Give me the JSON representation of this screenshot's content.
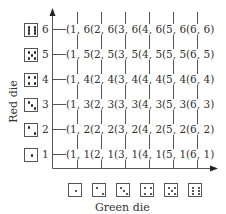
{
  "chart_data": {
    "type": "table",
    "title": "",
    "xlabel": "Green die",
    "ylabel": "Red die",
    "x_ticks": [
      "1",
      "2",
      "3",
      "4",
      "5",
      "6"
    ],
    "y_ticks": [
      "1",
      "2",
      "3",
      "4",
      "5",
      "6"
    ],
    "rows": [
      {
        "red": "6",
        "cells": [
          "(1, 6)",
          "(2, 6)",
          "(3, 6)",
          "(4, 6)",
          "(5, 6)",
          "(6, 6)"
        ]
      },
      {
        "red": "5",
        "cells": [
          "(1, 5)",
          "(2, 5)",
          "(3, 5)",
          "(4, 5)",
          "(5, 5)",
          "(6, 5)"
        ]
      },
      {
        "red": "4",
        "cells": [
          "(1, 4)",
          "(2, 4)",
          "(3, 4)",
          "(4, 4)",
          "(5, 4)",
          "(6, 4)"
        ]
      },
      {
        "red": "3",
        "cells": [
          "(1, 3)",
          "(2, 3)",
          "(3, 3)",
          "(4, 3)",
          "(5, 3)",
          "(6, 3)"
        ]
      },
      {
        "red": "2",
        "cells": [
          "(1, 2)",
          "(2, 2)",
          "(3, 2)",
          "(4, 2)",
          "(5, 2)",
          "(6, 2)"
        ]
      },
      {
        "red": "1",
        "cells": [
          "(1, 1)",
          "(2, 1)",
          "(3, 1)",
          "(4, 1)",
          "(5, 1)",
          "(6, 1)"
        ]
      }
    ]
  },
  "axes": {
    "x_label": "Green die",
    "y_label": "Red die",
    "y_numbers": [
      "6",
      "5",
      "4",
      "3",
      "2",
      "1"
    ]
  },
  "icons": {
    "x_dice": [
      "die-face-1",
      "die-face-2",
      "die-face-3",
      "die-face-4",
      "die-face-5",
      "die-face-6"
    ],
    "y_dice": [
      "die-face-6",
      "die-face-5",
      "die-face-4",
      "die-face-3",
      "die-face-2",
      "die-face-1"
    ]
  },
  "colors": {
    "line": "#555555",
    "text": "#333333",
    "pip": "#222222"
  }
}
